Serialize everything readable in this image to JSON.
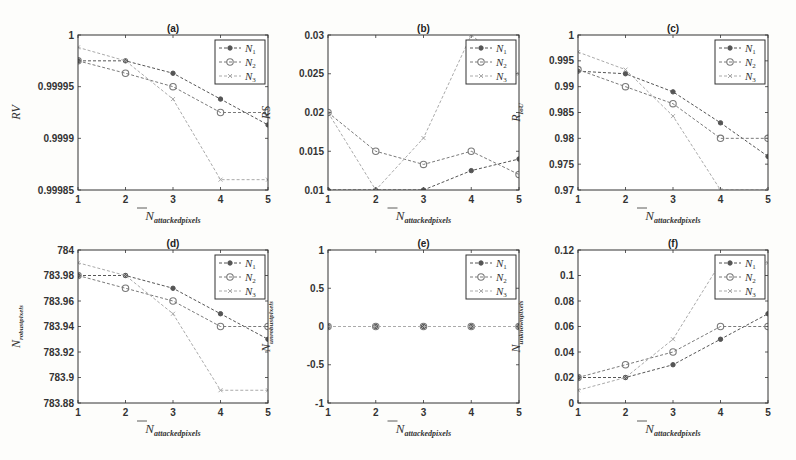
{
  "chart_data": [
    {
      "id": "a",
      "type": "line",
      "title": "(a)",
      "xlabel": "N_attackedpixels",
      "ylabel": "RV",
      "ylabel_sub": "",
      "x": [
        1,
        2,
        3,
        4,
        5
      ],
      "xlim": [
        1,
        5
      ],
      "ylim": [
        0.99985,
        1.0
      ],
      "yticks": [
        0.99985,
        0.9999,
        0.99995,
        1
      ],
      "ytick_labels": [
        "0.99985",
        "0.9999",
        "0.99995",
        "1"
      ],
      "grid": false,
      "legend_position": "upper right",
      "series": [
        {
          "name": "N1",
          "values": [
            0.999975,
            0.999975,
            0.999963,
            0.999938,
            0.999913
          ]
        },
        {
          "name": "N2",
          "values": [
            0.999975,
            0.999963,
            0.99995,
            0.999925,
            0.999925
          ]
        },
        {
          "name": "N3",
          "values": [
            0.999988,
            0.999975,
            0.999938,
            0.99986,
            0.99986
          ]
        }
      ]
    },
    {
      "id": "b",
      "type": "line",
      "title": "(b)",
      "xlabel": "N_attackedpixels",
      "ylabel": "RS",
      "ylabel_sub": "",
      "x": [
        1,
        2,
        3,
        4,
        5
      ],
      "xlim": [
        1,
        5
      ],
      "ylim": [
        0.01,
        0.03
      ],
      "yticks": [
        0.01,
        0.015,
        0.02,
        0.025,
        0.03
      ],
      "ytick_labels": [
        "0.01",
        "0.015",
        "0.02",
        "0.025",
        "0.03"
      ],
      "grid": false,
      "legend_position": "upper right",
      "series": [
        {
          "name": "N1",
          "values": [
            0.01,
            0.01,
            0.01,
            0.0125,
            0.014
          ]
        },
        {
          "name": "N2",
          "values": [
            0.02,
            0.015,
            0.0133,
            0.015,
            0.012
          ]
        },
        {
          "name": "N3",
          "values": [
            0.02,
            0.01,
            0.0167,
            0.03,
            0.025
          ]
        }
      ]
    },
    {
      "id": "c",
      "type": "line",
      "title": "(c)",
      "xlabel": "N_attackedpixels",
      "ylabel": "R",
      "ylabel_sub": "IoU",
      "x": [
        1,
        2,
        3,
        4,
        5
      ],
      "xlim": [
        1,
        5
      ],
      "ylim": [
        0.97,
        1.0
      ],
      "yticks": [
        0.97,
        0.975,
        0.98,
        0.985,
        0.99,
        0.995,
        1
      ],
      "ytick_labels": [
        "0.97",
        "0.975",
        "0.98",
        "0.985",
        "0.99",
        "0.995",
        "1"
      ],
      "grid": false,
      "legend_position": "upper right",
      "series": [
        {
          "name": "N1",
          "values": [
            0.993,
            0.9925,
            0.989,
            0.983,
            0.9765
          ]
        },
        {
          "name": "N2",
          "values": [
            0.9933,
            0.99,
            0.9867,
            0.98,
            0.98
          ]
        },
        {
          "name": "N3",
          "values": [
            0.9967,
            0.9933,
            0.9843,
            0.97,
            0.97
          ]
        }
      ]
    },
    {
      "id": "d",
      "type": "line",
      "title": "(d)",
      "xlabel": "N_attackedpixels",
      "ylabel": "N",
      "ylabel_sub": "robustpixels",
      "x": [
        1,
        2,
        3,
        4,
        5
      ],
      "xlim": [
        1,
        5
      ],
      "ylim": [
        783.88,
        784.0
      ],
      "yticks": [
        783.88,
        783.9,
        783.92,
        783.94,
        783.96,
        783.98,
        784
      ],
      "ytick_labels": [
        "783.88",
        "783.9",
        "783.92",
        "783.94",
        "783.96",
        "783.98",
        "784"
      ],
      "grid": false,
      "legend_position": "upper right",
      "series": [
        {
          "name": "N1",
          "values": [
            783.98,
            783.98,
            783.97,
            783.95,
            783.93
          ]
        },
        {
          "name": "N2",
          "values": [
            783.98,
            783.97,
            783.96,
            783.94,
            783.94
          ]
        },
        {
          "name": "N3",
          "values": [
            783.99,
            783.98,
            783.95,
            783.89,
            783.89
          ]
        }
      ]
    },
    {
      "id": "e",
      "type": "line",
      "title": "(e)",
      "xlabel": "N_attackedpixels",
      "ylabel": "N",
      "ylabel_sub": "unrobustpixels",
      "x": [
        1,
        2,
        3,
        4,
        5
      ],
      "xlim": [
        1,
        5
      ],
      "ylim": [
        -1,
        1
      ],
      "yticks": [
        -1,
        -0.5,
        0,
        0.5,
        1
      ],
      "ytick_labels": [
        "-1",
        "-0.5",
        "0",
        "0.5",
        "1"
      ],
      "grid": false,
      "legend_position": "upper right",
      "series": [
        {
          "name": "N1",
          "values": [
            0,
            0,
            0,
            0,
            0
          ]
        },
        {
          "name": "N2",
          "values": [
            0,
            0,
            0,
            0,
            0
          ]
        },
        {
          "name": "N3",
          "values": [
            0,
            0,
            0,
            0,
            0
          ]
        }
      ]
    },
    {
      "id": "f",
      "type": "line",
      "title": "(f)",
      "xlabel": "N_attackedpixels",
      "ylabel": "N",
      "ylabel_sub": "unknownpixels",
      "x": [
        1,
        2,
        3,
        4,
        5
      ],
      "xlim": [
        1,
        5
      ],
      "ylim": [
        0,
        0.12
      ],
      "yticks": [
        0,
        0.02,
        0.04,
        0.06,
        0.08,
        0.1,
        0.12
      ],
      "ytick_labels": [
        "0",
        "0.02",
        "0.04",
        "0.06",
        "0.08",
        "0.1",
        "0.12"
      ],
      "grid": false,
      "legend_position": "upper right",
      "series": [
        {
          "name": "N1",
          "values": [
            0.02,
            0.02,
            0.03,
            0.05,
            0.07
          ]
        },
        {
          "name": "N2",
          "values": [
            0.02,
            0.03,
            0.04,
            0.06,
            0.06
          ]
        },
        {
          "name": "N3",
          "values": [
            0.01,
            0.02,
            0.05,
            0.11,
            0.11
          ]
        }
      ]
    }
  ],
  "legend": [
    {
      "name": "N",
      "sub": "1",
      "color": "#555555",
      "marker": "dot"
    },
    {
      "name": "N",
      "sub": "2",
      "color": "#7a7a7a",
      "marker": "circle"
    },
    {
      "name": "N",
      "sub": "3",
      "color": "#aaaaaa",
      "marker": "x"
    }
  ],
  "xlabel": {
    "main": "N",
    "sub": "attackedpixels"
  }
}
